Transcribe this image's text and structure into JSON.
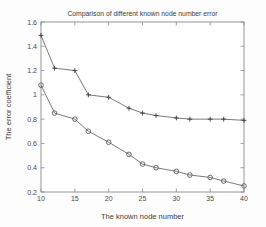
{
  "chart_data": {
    "type": "line",
    "title": "Comparison of different known node number error",
    "xlabel": "The known node number",
    "ylabel": "The error coefficient",
    "xlim": [
      10,
      40
    ],
    "ylim": [
      0.2,
      1.6
    ],
    "xticks": [
      10,
      15,
      20,
      25,
      30,
      35,
      40
    ],
    "xticklabels": [
      "10",
      "15",
      "20",
      "25",
      "30",
      "35",
      "40"
    ],
    "yticks": [
      0.2,
      0.4,
      0.6,
      0.8,
      1.0,
      1.2,
      1.4,
      1.6
    ],
    "yticklabels": [
      "0.2",
      "0.4",
      "0.6",
      "0.8",
      "1",
      "1.2",
      "1.4",
      "1.6"
    ],
    "grid": false,
    "legend": "none",
    "x": [
      10,
      12,
      15,
      17,
      20,
      23,
      25,
      27,
      30,
      32,
      35,
      37,
      40
    ],
    "series": [
      {
        "name": "upper-curve",
        "marker": "plus",
        "color": "#3a3a3a",
        "values": [
          1.49,
          1.22,
          1.2,
          1.0,
          0.98,
          0.89,
          0.85,
          0.83,
          0.81,
          0.8,
          0.8,
          0.8,
          0.79
        ]
      },
      {
        "name": "lower-curve",
        "marker": "circle",
        "color": "#5a5a5a",
        "values": [
          1.08,
          0.85,
          0.8,
          0.7,
          0.61,
          0.51,
          0.43,
          0.4,
          0.37,
          0.34,
          0.32,
          0.29,
          0.25
        ]
      }
    ]
  }
}
